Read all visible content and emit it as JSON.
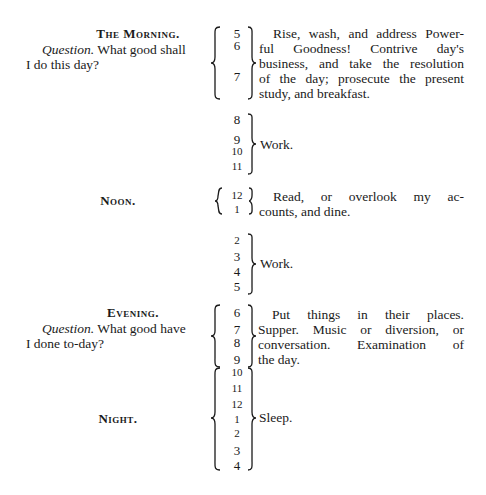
{
  "schedule": {
    "morning": {
      "heading": "The Morning.",
      "question_label": "Question.",
      "question_text_1": " What good shall",
      "question_text_2": "I do this day?",
      "hours": [
        "5",
        "6",
        "7"
      ],
      "description_lines": [
        "Rise, wash, and address Power-",
        "ful Goodness! Contrive day's",
        "business, and take the resolution",
        "of the day; prosecute the present",
        "study, and breakfast."
      ]
    },
    "work_am": {
      "hours": [
        "8",
        "9",
        "10",
        "11"
      ],
      "description": "Work."
    },
    "noon": {
      "heading": "Noon.",
      "hours": [
        "12",
        "1"
      ],
      "description_lines": [
        "Read, or overlook my ac-",
        "counts, and dine."
      ]
    },
    "work_pm": {
      "hours": [
        "2",
        "3",
        "4",
        "5"
      ],
      "description": "Work."
    },
    "evening": {
      "heading": "Evening.",
      "question_label": "Question.",
      "question_text_1": " What good have",
      "question_text_2": "I done to-day?",
      "hours": [
        "6",
        "7",
        "8",
        "9"
      ],
      "description_lines": [
        "Put things in their places.",
        "Supper. Music or diversion, or",
        "conversation. Examination of",
        "the day."
      ]
    },
    "night": {
      "heading": "Night.",
      "hours": [
        "10",
        "11",
        "12",
        "1",
        "2",
        "3",
        "4"
      ],
      "description": "Sleep."
    }
  }
}
